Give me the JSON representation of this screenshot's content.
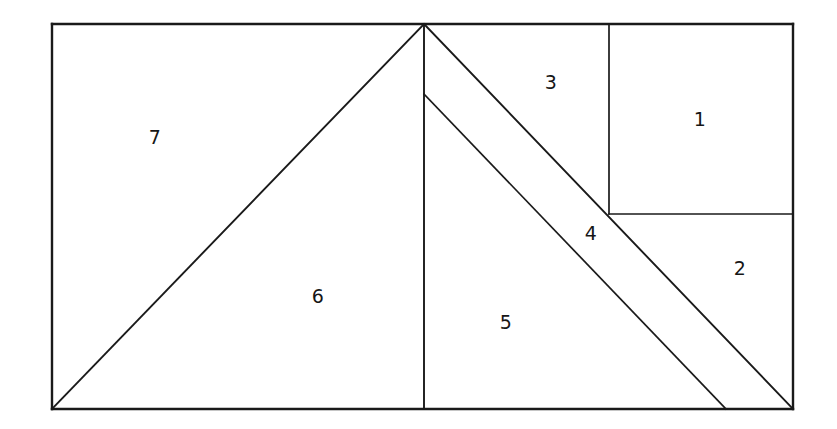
{
  "figure": {
    "kind": "geometric-dissection-diagram",
    "background_color": "#ffffff",
    "line_color": "#1a1a1a",
    "label_color": "#161616",
    "canvas": {
      "width": 837,
      "height": 429
    },
    "outer_rect": {
      "x1": 52,
      "y1": 24,
      "x2": 793,
      "y2": 409
    },
    "vertices": {
      "top_left": {
        "x": 52,
        "y": 24
      },
      "top_right": {
        "x": 793,
        "y": 24
      },
      "bottom_left": {
        "x": 52,
        "y": 409
      },
      "bottom_right": {
        "x": 793,
        "y": 409
      },
      "apex": {
        "x": 424,
        "y": 24
      },
      "inner_apex": {
        "x": 424,
        "y": 94
      },
      "bottom_mid": {
        "x": 424,
        "y": 409
      },
      "strip_bottom": {
        "x": 726,
        "y": 409
      },
      "corner_junction": {
        "x": 609,
        "y": 214
      },
      "top_divider_top": {
        "x": 609,
        "y": 24
      },
      "right_divider_right": {
        "x": 793,
        "y": 214
      }
    },
    "edges": [
      {
        "name": "outer-top",
        "from": [
          52,
          24
        ],
        "to": [
          793,
          24
        ]
      },
      {
        "name": "outer-right",
        "from": [
          793,
          24
        ],
        "to": [
          793,
          409
        ]
      },
      {
        "name": "outer-bottom",
        "from": [
          793,
          409
        ],
        "to": [
          52,
          409
        ]
      },
      {
        "name": "outer-left",
        "from": [
          52,
          409
        ],
        "to": [
          52,
          24
        ]
      },
      {
        "name": "apex-to-bottom-left",
        "from": [
          424,
          24
        ],
        "to": [
          52,
          409
        ]
      },
      {
        "name": "apex-to-bottom-right",
        "from": [
          424,
          24
        ],
        "to": [
          793,
          409
        ]
      },
      {
        "name": "center-vertical",
        "from": [
          424,
          24
        ],
        "to": [
          424,
          409
        ]
      },
      {
        "name": "inner-apex-to-strip-bottom",
        "from": [
          424,
          94
        ],
        "to": [
          726,
          409
        ]
      },
      {
        "name": "upper-vertical-divider",
        "from": [
          609,
          24
        ],
        "to": [
          609,
          214
        ]
      },
      {
        "name": "right-horizontal-divider",
        "from": [
          609,
          214
        ],
        "to": [
          793,
          214
        ]
      }
    ],
    "regions": [
      {
        "id": "region-1",
        "label": "1",
        "label_position": {
          "x": 700,
          "y": 119
        },
        "shape": "rectangle",
        "polygon": [
          [
            609,
            24
          ],
          [
            793,
            24
          ],
          [
            793,
            214
          ],
          [
            609,
            214
          ]
        ]
      },
      {
        "id": "region-2",
        "label": "2",
        "label_position": {
          "x": 740,
          "y": 268
        },
        "shape": "triangle",
        "polygon": [
          [
            609,
            214
          ],
          [
            793,
            214
          ],
          [
            793,
            409
          ]
        ]
      },
      {
        "id": "region-3",
        "label": "3",
        "label_position": {
          "x": 551,
          "y": 82
        },
        "shape": "triangle",
        "polygon": [
          [
            424,
            24
          ],
          [
            609,
            24
          ],
          [
            609,
            214
          ]
        ]
      },
      {
        "id": "region-4",
        "label": "4",
        "label_position": {
          "x": 591,
          "y": 233
        },
        "shape": "quadrilateral-strip",
        "polygon": [
          [
            424,
            24
          ],
          [
            793,
            409
          ],
          [
            726,
            409
          ],
          [
            424,
            94
          ]
        ]
      },
      {
        "id": "region-5",
        "label": "5",
        "label_position": {
          "x": 506,
          "y": 322
        },
        "shape": "polygon",
        "polygon": [
          [
            424,
            94
          ],
          [
            726,
            409
          ],
          [
            424,
            409
          ]
        ]
      },
      {
        "id": "region-6",
        "label": "6",
        "label_position": {
          "x": 318,
          "y": 296
        },
        "shape": "triangle",
        "polygon": [
          [
            424,
            24
          ],
          [
            424,
            409
          ],
          [
            52,
            409
          ]
        ]
      },
      {
        "id": "region-7",
        "label": "7",
        "label_position": {
          "x": 155,
          "y": 137
        },
        "shape": "triangle",
        "polygon": [
          [
            52,
            24
          ],
          [
            424,
            24
          ],
          [
            52,
            409
          ]
        ]
      }
    ]
  }
}
